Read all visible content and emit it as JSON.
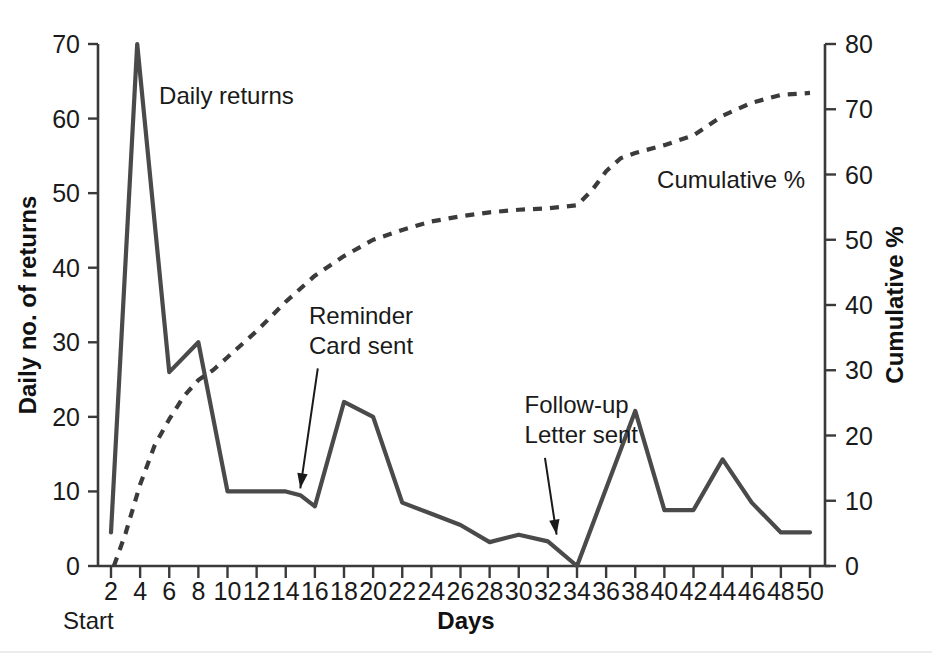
{
  "chart_data": {
    "type": "line",
    "title": "",
    "xlabel": "Days",
    "ylabel": "Daily no. of returns",
    "y2label": "Cumulative %",
    "xlim": [
      2,
      50
    ],
    "ylim": [
      0,
      70
    ],
    "y2lim": [
      0,
      80
    ],
    "grid": false,
    "legend_position": "inline-annotations",
    "x_ticks": [
      2,
      4,
      6,
      8,
      10,
      12,
      14,
      16,
      18,
      20,
      22,
      24,
      26,
      28,
      30,
      32,
      34,
      36,
      38,
      40,
      42,
      44,
      46,
      48,
      50
    ],
    "y_ticks": [
      0,
      10,
      20,
      30,
      40,
      50,
      60,
      70
    ],
    "y2_ticks": [
      0,
      10,
      20,
      30,
      40,
      50,
      60,
      70,
      80
    ],
    "series": [
      {
        "name": "Daily returns",
        "axis": "left",
        "style": "solid",
        "color": "#4a4a4a",
        "x": [
          2,
          3.8,
          6,
          8,
          10,
          12,
          14,
          15,
          16,
          18,
          20,
          22,
          24,
          26,
          28,
          30,
          32,
          34,
          38,
          40,
          42,
          44,
          46,
          48,
          50
        ],
        "values": [
          4.5,
          70,
          26,
          30,
          10,
          10,
          10,
          9.5,
          8,
          22,
          20,
          8.5,
          7,
          5.5,
          3.2,
          4.2,
          3.3,
          0,
          20.8,
          7.5,
          7.5,
          14.3,
          8.5,
          4.5,
          4.5
        ]
      },
      {
        "name": "Cumulative %",
        "axis": "right",
        "style": "dashed",
        "color": "#3b3b3b",
        "x": [
          2.2,
          3,
          4,
          5,
          6,
          7,
          8,
          9,
          10,
          12,
          14,
          16,
          18,
          20,
          22,
          24,
          26,
          28,
          30,
          32,
          34,
          35,
          36,
          37,
          38,
          40,
          42,
          44,
          46,
          48,
          50
        ],
        "values": [
          0,
          5,
          12.5,
          18.5,
          22.5,
          26,
          28.5,
          30,
          32,
          36,
          40.5,
          44.5,
          47.5,
          50,
          51.5,
          52.8,
          53.6,
          54.2,
          54.6,
          54.8,
          55.3,
          57.5,
          60.5,
          62.5,
          63.3,
          64.5,
          66,
          69,
          71,
          72.2,
          72.5
        ]
      }
    ],
    "annotations": [
      {
        "name": "daily-returns-label",
        "text": "Daily returns",
        "x": 5.3,
        "y": 62
      },
      {
        "name": "cumulative-label",
        "text": "Cumulative %",
        "x": 39.5,
        "y_pct": 58
      },
      {
        "name": "reminder-card-line1",
        "text": "Reminder",
        "x": 15.6,
        "y": 32.5
      },
      {
        "name": "reminder-card-line2",
        "text": "Card sent",
        "x": 15.6,
        "y": 28.5
      },
      {
        "name": "follow-up-line1",
        "text": "Follow-up",
        "x": 30.4,
        "y": 20.5
      },
      {
        "name": "follow-up-line2",
        "text": "Letter sent",
        "x": 30.4,
        "y": 16.5
      },
      {
        "name": "start-label",
        "text": "Start"
      }
    ],
    "arrows": [
      {
        "name": "reminder-card-arrow",
        "from_x": 16.2,
        "from_y": 26.5,
        "to_x": 15.0,
        "to_y": 10.4
      },
      {
        "name": "follow-up-arrow",
        "from_x": 31.8,
        "from_y": 14.5,
        "to_x": 32.6,
        "to_y": 4.2
      }
    ],
    "colors": {
      "daily_returns": "#4a4a4a",
      "cumulative": "#3b3b3b",
      "axis": "#3a3a3a",
      "text": "#1a1a1a",
      "background": "#ffffff"
    }
  },
  "axes": {
    "left_title": "Daily no. of returns",
    "right_title": "Cumulative %",
    "bottom_title": "Days",
    "start_marker": "Start"
  }
}
